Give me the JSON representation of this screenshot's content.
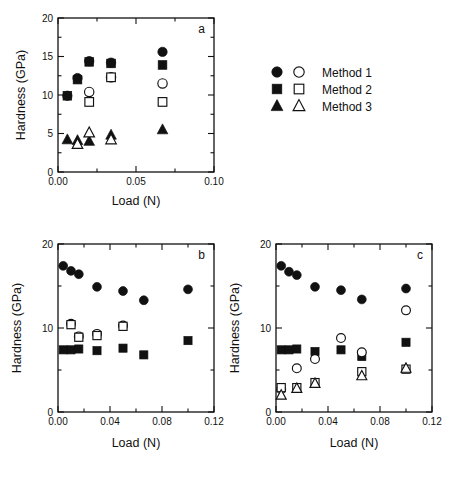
{
  "figure": {
    "background": "#ffffff",
    "ink": "#111111"
  },
  "legend": {
    "name": "method-legend",
    "position": "right-top",
    "entries": [
      {
        "label": "Method 1",
        "marker": "circle",
        "filled_symbol": "filled-circle",
        "open_symbol": "open-circle"
      },
      {
        "label": "Method 2",
        "marker": "square",
        "filled_symbol": "filled-square",
        "open_symbol": "open-square"
      },
      {
        "label": "Method 3",
        "marker": "triangle",
        "filled_symbol": "filled-triangle",
        "open_symbol": "open-triangle"
      }
    ]
  },
  "chart_data": [
    {
      "type": "scatter",
      "panel": "a",
      "title": "",
      "xlabel": "Load (N)",
      "ylabel": "Hardness (GPa)",
      "xlim": [
        0.0,
        0.1
      ],
      "ylim": [
        0,
        20
      ],
      "xticks": [
        0.0,
        0.05,
        0.1
      ],
      "xticklabels": [
        "0.00",
        "0.05",
        "0.10"
      ],
      "xminorticks": [
        0.025,
        0.075
      ],
      "yticks": [
        0,
        5,
        10,
        15,
        20
      ],
      "yticklabels": [
        "0",
        "5",
        "10",
        "15",
        "20"
      ],
      "yminorticks": [
        2.5,
        7.5,
        12.5,
        17.5
      ],
      "grid": false,
      "series": [
        {
          "name": "Method 1 filled",
          "marker": "filled-circle",
          "x": [
            0.006,
            0.0125,
            0.02,
            0.034,
            0.067
          ],
          "y": [
            9.9,
            12.2,
            14.4,
            14.2,
            15.6
          ]
        },
        {
          "name": "Method 2 filled",
          "marker": "filled-square",
          "x": [
            0.006,
            0.0125,
            0.02,
            0.034,
            0.067
          ],
          "y": [
            9.9,
            12.0,
            14.3,
            14.1,
            13.9
          ]
        },
        {
          "name": "Method 1 open",
          "marker": "open-circle",
          "x": [
            0.02,
            0.034,
            0.067
          ],
          "y": [
            10.4,
            12.3,
            11.5
          ]
        },
        {
          "name": "Method 2 open",
          "marker": "open-square",
          "x": [
            0.02,
            0.034,
            0.067
          ],
          "y": [
            9.1,
            12.3,
            9.1
          ]
        },
        {
          "name": "Method 3 filled",
          "marker": "filled-triangle",
          "x": [
            0.006,
            0.0125,
            0.02,
            0.034,
            0.067
          ],
          "y": [
            4.2,
            4.1,
            4.0,
            4.8,
            5.5
          ]
        },
        {
          "name": "Method 3 open",
          "marker": "open-triangle",
          "x": [
            0.0125,
            0.02,
            0.034
          ],
          "y": [
            3.6,
            5.1,
            4.2
          ]
        }
      ]
    },
    {
      "type": "scatter",
      "panel": "b",
      "title": "",
      "xlabel": "Load (N)",
      "ylabel": "Hardness (GPa)",
      "xlim": [
        0.0,
        0.12
      ],
      "ylim": [
        0,
        20
      ],
      "xticks": [
        0.0,
        0.04,
        0.08,
        0.12
      ],
      "xticklabels": [
        "0.00",
        "0.04",
        "0.08",
        "0.12"
      ],
      "xminorticks": [
        0.02,
        0.06,
        0.1
      ],
      "yticks": [
        0,
        10,
        20
      ],
      "yticklabels": [
        "0",
        "10",
        "20"
      ],
      "yminorticks": [
        5,
        15
      ],
      "grid": false,
      "series": [
        {
          "name": "Method 1 filled",
          "marker": "filled-circle",
          "x": [
            0.004,
            0.01,
            0.016,
            0.03,
            0.05,
            0.066,
            0.1
          ],
          "y": [
            17.4,
            16.8,
            16.4,
            14.9,
            14.4,
            13.3,
            14.6
          ]
        },
        {
          "name": "Method 2 filled",
          "marker": "filled-square",
          "x": [
            0.004,
            0.01,
            0.016,
            0.03,
            0.05,
            0.066,
            0.1
          ],
          "y": [
            7.4,
            7.4,
            7.5,
            7.3,
            7.6,
            6.8,
            8.5
          ]
        },
        {
          "name": "Method 1 open",
          "marker": "open-circle",
          "x": [
            0.01,
            0.016,
            0.03,
            0.05
          ],
          "y": [
            10.5,
            9.0,
            9.3,
            10.3
          ]
        },
        {
          "name": "Method 2 open",
          "marker": "open-square",
          "x": [
            0.01,
            0.016,
            0.03,
            0.05
          ],
          "y": [
            10.4,
            8.9,
            9.1,
            10.2
          ]
        }
      ]
    },
    {
      "type": "scatter",
      "panel": "c",
      "title": "",
      "xlabel": "Load (N)",
      "ylabel": "Hardness (GPa)",
      "xlim": [
        0.0,
        0.12
      ],
      "ylim": [
        0,
        20
      ],
      "xticks": [
        0.0,
        0.04,
        0.08,
        0.12
      ],
      "xticklabels": [
        "0.00",
        "0.04",
        "0.08",
        "0.12"
      ],
      "xminorticks": [
        0.02,
        0.06,
        0.1
      ],
      "yticks": [
        0,
        10,
        20
      ],
      "yticklabels": [
        "0",
        "10",
        "20"
      ],
      "yminorticks": [
        5,
        15
      ],
      "grid": false,
      "series": [
        {
          "name": "Method 1 filled",
          "marker": "filled-circle",
          "x": [
            0.004,
            0.01,
            0.016,
            0.03,
            0.05,
            0.066,
            0.1
          ],
          "y": [
            17.4,
            16.7,
            16.3,
            14.9,
            14.5,
            13.4,
            14.7
          ]
        },
        {
          "name": "Method 2 filled",
          "marker": "filled-square",
          "x": [
            0.004,
            0.01,
            0.016,
            0.03,
            0.05,
            0.066,
            0.1
          ],
          "y": [
            7.4,
            7.4,
            7.5,
            7.2,
            7.4,
            6.6,
            8.3
          ]
        },
        {
          "name": "Method 1 open",
          "marker": "open-circle",
          "x": [
            0.004,
            0.016,
            0.03,
            0.05,
            0.066,
            0.1
          ],
          "y": [
            2.7,
            5.2,
            6.3,
            8.8,
            7.1,
            12.1
          ]
        },
        {
          "name": "Method 2 open",
          "marker": "open-square",
          "x": [
            0.004,
            0.016,
            0.03,
            0.066,
            0.1
          ],
          "y": [
            2.9,
            2.9,
            3.5,
            4.8,
            5.1
          ]
        },
        {
          "name": "Method 3 open",
          "marker": "open-triangle",
          "x": [
            0.004,
            0.016,
            0.03,
            0.066,
            0.1
          ],
          "y": [
            2.0,
            2.8,
            3.4,
            4.3,
            5.2
          ]
        }
      ]
    }
  ]
}
